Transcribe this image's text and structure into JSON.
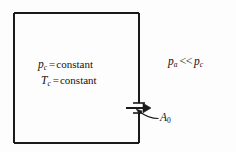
{
  "figure": {
    "type": "schematic-diagram",
    "background_color": "#fdfdfd",
    "line_color": "#1a1a1a"
  },
  "chamber": {
    "name": "combustion-chamber-box",
    "x": 14,
    "y": 13,
    "width": 125,
    "height": 130,
    "border_width": 2
  },
  "orifice": {
    "name": "orifice-gap",
    "wall_x": 139,
    "gap_top": 103,
    "gap_bottom": 113,
    "label": "A",
    "label_subscript": "0",
    "leader_from_x": 158,
    "leader_from_y": 118,
    "leader_to_x": 137,
    "leader_to_y": 110
  },
  "flow_arrow": {
    "name": "discharge-flow-arrow",
    "from_x": 126,
    "to_x": 150,
    "y": 108,
    "direction": "right"
  },
  "interior_conditions": [
    {
      "id": "chamber-pressure",
      "symbol": "p",
      "subscript": "c",
      "relation": "=",
      "value": "constant"
    },
    {
      "id": "chamber-temperature",
      "symbol": "T",
      "subscript": "c",
      "relation": "=",
      "value": "constant"
    }
  ],
  "exterior_condition": {
    "id": "ambient-vs-chamber-pressure",
    "left_symbol": "p",
    "left_subscript": "a",
    "operator": "<<",
    "right_symbol": "p",
    "right_subscript": "c"
  }
}
